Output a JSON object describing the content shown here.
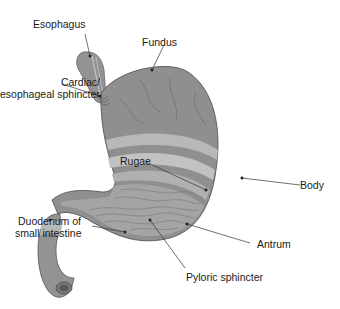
{
  "diagram": {
    "labels": {
      "esophagus": "Esophagus",
      "fundus": "Fundus",
      "cardiac_line1": "Cardiac/",
      "cardiac_line2": "esophageal sphincter",
      "rugae": "Rugae",
      "body": "Body",
      "duodenum_line1": "Duodenum of",
      "duodenum_line2": "small intestine",
      "antrum": "Antrum",
      "pyloric": "Pyloric sphincter"
    },
    "colors": {
      "outer_wall": "#8f8f8f",
      "muscle_layer": "#b3b3b3",
      "mucosa": "#a6a6a6",
      "outline": "#555555",
      "leader_line": "#333333",
      "text": "#1a1a1a"
    }
  }
}
